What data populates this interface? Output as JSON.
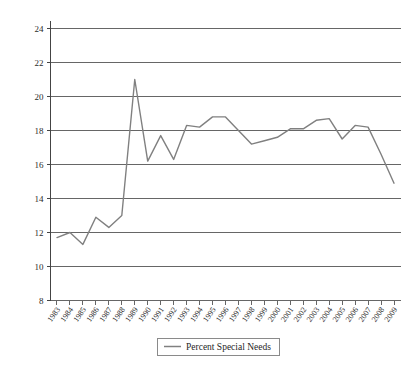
{
  "chart_data": {
    "type": "line",
    "title": "",
    "xlabel": "",
    "ylabel": "",
    "grid": true,
    "legend_position": "bottom",
    "ylim": [
      8,
      24
    ],
    "yticks": [
      8,
      10,
      12,
      14,
      16,
      18,
      20,
      22,
      24
    ],
    "ytick_labels": [
      "8",
      "10",
      "12",
      "14",
      "16",
      "18",
      "20",
      "22",
      "24"
    ],
    "categories": [
      "1983",
      "1984",
      "1985",
      "1986",
      "1987",
      "1988",
      "1989",
      "1990",
      "1991",
      "1992",
      "1993",
      "1994",
      "1995",
      "1996",
      "1997",
      "1998",
      "1999",
      "2000",
      "2001",
      "2002",
      "2003",
      "2004",
      "2005",
      "2006",
      "2007",
      "2008",
      "2009"
    ],
    "series": [
      {
        "name": "Percent Special Needs",
        "color": "#808080",
        "values": [
          11.7,
          12.0,
          11.3,
          12.9,
          12.3,
          13.0,
          21.0,
          16.2,
          17.7,
          16.3,
          18.3,
          18.2,
          18.8,
          18.8,
          18.0,
          17.2,
          17.4,
          17.6,
          18.1,
          18.1,
          18.6,
          18.7,
          17.5,
          18.3,
          18.2,
          16.6,
          14.9
        ]
      }
    ],
    "legend": [
      {
        "label": "Percent Special Needs",
        "color": "#808080"
      }
    ]
  }
}
